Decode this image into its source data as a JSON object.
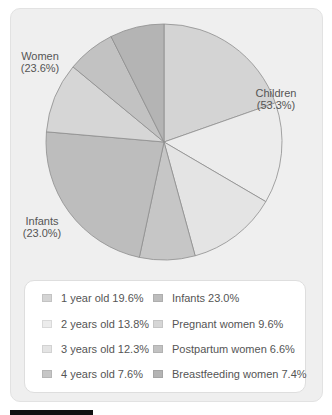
{
  "chart_data": {
    "type": "pie",
    "title": "",
    "categories": [
      "1 year old",
      "2 years old",
      "3 years old",
      "4 years old",
      "Infants",
      "Pregnant women",
      "Postpartum women",
      "Breastfeeding women"
    ],
    "values": [
      19.6,
      13.8,
      12.3,
      7.6,
      23.0,
      9.6,
      6.6,
      7.4
    ],
    "colors": [
      "#d4d4d4",
      "#ececec",
      "#e4e4e4",
      "#c6c6c6",
      "#bdbdbd",
      "#d6d6d6",
      "#c2c2c2",
      "#b4b4b4"
    ],
    "group_labels": [
      {
        "label": "Children",
        "value": "(53.3%)"
      },
      {
        "label": "Women",
        "value": "(23.6%)"
      },
      {
        "label": "Infants",
        "value": "(23.0%)"
      }
    ],
    "legend_position": "bottom",
    "start_angle": "top, clockwise"
  },
  "labels": {
    "children": {
      "name": "Children",
      "pct": "(53.3%)"
    },
    "women": {
      "name": "Women",
      "pct": "(23.6%)"
    },
    "infants": {
      "name": "Infants",
      "pct": "(23.0%)"
    }
  },
  "legend": {
    "items": [
      {
        "text": "1 year old 19.6%",
        "color": "#d4d4d4"
      },
      {
        "text": "2 years old 13.8%",
        "color": "#ececec"
      },
      {
        "text": "3 years old 12.3%",
        "color": "#e4e4e4"
      },
      {
        "text": "4 years old 7.6%",
        "color": "#c6c6c6"
      },
      {
        "text": "Infants 23.0%",
        "color": "#bdbdbd"
      },
      {
        "text": "Pregnant women 9.6%",
        "color": "#d6d6d6"
      },
      {
        "text": "Postpartum women 6.6%",
        "color": "#c2c2c2"
      },
      {
        "text": "Breastfeeding women 7.4%",
        "color": "#b4b4b4"
      }
    ]
  }
}
